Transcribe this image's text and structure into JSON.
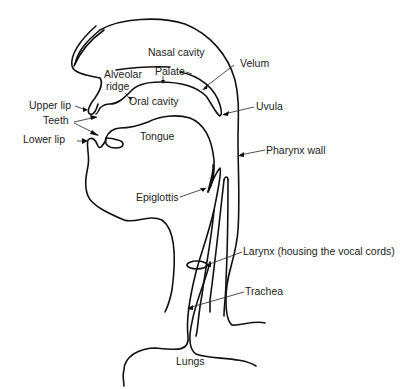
{
  "diagram": {
    "stroke_color": "#111111",
    "background": "#ffffff",
    "labels": {
      "nasal_cavity": "Nasal cavity",
      "palate": "Palate",
      "alveolar_ridge_line1": "Alveolar",
      "alveolar_ridge_line2": "ridge",
      "oral_cavity": "Oral cavity",
      "velum": "Velum",
      "uvula": "Uvula",
      "upper_lip": "Upper lip",
      "teeth": "Teeth",
      "lower_lip": "Lower lip",
      "tongue": "Tongue",
      "pharynx_wall": "Pharynx wall",
      "epiglottis": "Epiglottis",
      "larynx": "Larynx (housing the vocal cords)",
      "trachea": "Trachea",
      "lungs": "Lungs"
    }
  }
}
